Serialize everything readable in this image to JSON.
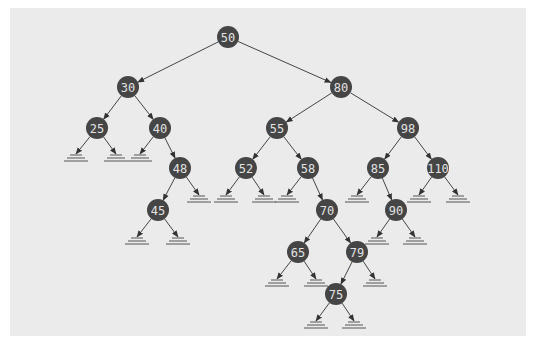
{
  "diagram": {
    "type": "binary-search-tree",
    "colors": {
      "background": "#ebebeb",
      "node_fill": "#454545",
      "node_text": "#e2e2e2",
      "edge": "#444444"
    },
    "node_radius": 11,
    "nodes": [
      {
        "id": "n50",
        "label": "50",
        "x": 228,
        "y": 37
      },
      {
        "id": "n30",
        "label": "30",
        "x": 128,
        "y": 87
      },
      {
        "id": "n80",
        "label": "80",
        "x": 341,
        "y": 87
      },
      {
        "id": "n25",
        "label": "25",
        "x": 97,
        "y": 128
      },
      {
        "id": "n40",
        "label": "40",
        "x": 160,
        "y": 128
      },
      {
        "id": "n55",
        "label": "55",
        "x": 277,
        "y": 128
      },
      {
        "id": "n98",
        "label": "98",
        "x": 408,
        "y": 128
      },
      {
        "id": "n48",
        "label": "48",
        "x": 180,
        "y": 168
      },
      {
        "id": "n52",
        "label": "52",
        "x": 246,
        "y": 168
      },
      {
        "id": "n58",
        "label": "58",
        "x": 308,
        "y": 168
      },
      {
        "id": "n85",
        "label": "85",
        "x": 378,
        "y": 168
      },
      {
        "id": "n110",
        "label": "110",
        "x": 438,
        "y": 168
      },
      {
        "id": "n45",
        "label": "45",
        "x": 158,
        "y": 210
      },
      {
        "id": "n70",
        "label": "70",
        "x": 327,
        "y": 210
      },
      {
        "id": "n90",
        "label": "90",
        "x": 396,
        "y": 210
      },
      {
        "id": "n65",
        "label": "65",
        "x": 298,
        "y": 252
      },
      {
        "id": "n79",
        "label": "79",
        "x": 357,
        "y": 252
      },
      {
        "id": "n75",
        "label": "75",
        "x": 336,
        "y": 294
      }
    ],
    "edges": [
      [
        "n50",
        "n30"
      ],
      [
        "n50",
        "n80"
      ],
      [
        "n30",
        "n25"
      ],
      [
        "n30",
        "n40"
      ],
      [
        "n80",
        "n55"
      ],
      [
        "n80",
        "n98"
      ],
      [
        "n40",
        "n48"
      ],
      [
        "n55",
        "n52"
      ],
      [
        "n55",
        "n58"
      ],
      [
        "n98",
        "n85"
      ],
      [
        "n98",
        "n110"
      ],
      [
        "n48",
        "n45"
      ],
      [
        "n58",
        "n70"
      ],
      [
        "n85",
        "n90"
      ],
      [
        "n70",
        "n65"
      ],
      [
        "n70",
        "n79"
      ],
      [
        "n79",
        "n75"
      ]
    ],
    "nil_leaves": [
      {
        "parent": "n25",
        "x": 76,
        "y": 158
      },
      {
        "parent": "n25",
        "x": 116,
        "y": 158
      },
      {
        "parent": "n40",
        "x": 140,
        "y": 158
      },
      {
        "parent": "n48",
        "x": 199,
        "y": 199
      },
      {
        "parent": "n45",
        "x": 137,
        "y": 241
      },
      {
        "parent": "n45",
        "x": 178,
        "y": 241
      },
      {
        "parent": "n52",
        "x": 226,
        "y": 199
      },
      {
        "parent": "n52",
        "x": 264,
        "y": 199
      },
      {
        "parent": "n58",
        "x": 287,
        "y": 199
      },
      {
        "parent": "n85",
        "x": 357,
        "y": 199
      },
      {
        "parent": "n110",
        "x": 419,
        "y": 199
      },
      {
        "parent": "n110",
        "x": 458,
        "y": 199
      },
      {
        "parent": "n90",
        "x": 377,
        "y": 241
      },
      {
        "parent": "n90",
        "x": 415,
        "y": 241
      },
      {
        "parent": "n65",
        "x": 277,
        "y": 283
      },
      {
        "parent": "n65",
        "x": 316,
        "y": 283
      },
      {
        "parent": "n79",
        "x": 375,
        "y": 283
      },
      {
        "parent": "n75",
        "x": 316,
        "y": 325
      },
      {
        "parent": "n75",
        "x": 354,
        "y": 325
      }
    ]
  }
}
